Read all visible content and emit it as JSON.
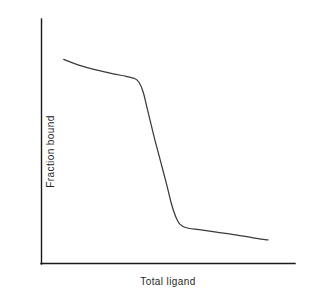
{
  "chart_data": {
    "type": "line",
    "title": "",
    "subtitle": "",
    "xlabel": "Total ligand",
    "ylabel": "Fraction bound",
    "xlim": [
      0,
      1
    ],
    "ylim": [
      0,
      1
    ],
    "grid": false,
    "legend": null,
    "legend_position": "none",
    "xticks": [],
    "yticks": [],
    "xticklabels": [],
    "yticklabels": [],
    "annotations": [],
    "series": [
      {
        "name": "Fraction bound",
        "color": "#3a3a3a",
        "x": [
          0.05,
          0.12,
          0.2,
          0.28,
          0.34,
          0.38,
          0.4,
          0.42,
          0.44,
          0.47,
          0.5,
          0.53,
          0.55,
          0.57,
          0.59,
          0.62,
          0.68,
          0.76,
          0.85,
          0.93,
          1.0
        ],
        "y": [
          0.835,
          0.812,
          0.792,
          0.776,
          0.766,
          0.757,
          0.742,
          0.7,
          0.628,
          0.52,
          0.42,
          0.32,
          0.248,
          0.195,
          0.163,
          0.148,
          0.14,
          0.13,
          0.119,
          0.107,
          0.098
        ]
      }
    ]
  },
  "axes": {
    "y_axis_name": "y-axis",
    "x_axis_name": "x-axis"
  }
}
